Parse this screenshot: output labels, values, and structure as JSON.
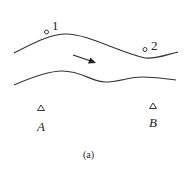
{
  "diagram": {
    "caption": "(a)",
    "flow_direction": "arrow pointing downstream to the right",
    "points": [
      {
        "id": "point-1",
        "label": "1",
        "marker": "circle"
      },
      {
        "id": "point-2",
        "label": "2",
        "marker": "circle"
      }
    ],
    "stations": [
      {
        "id": "station-a",
        "label": "A",
        "marker": "triangle"
      },
      {
        "id": "station-b",
        "label": "B",
        "marker": "triangle"
      }
    ],
    "colors": {
      "line": "#333333",
      "background": "#ffffff"
    }
  }
}
